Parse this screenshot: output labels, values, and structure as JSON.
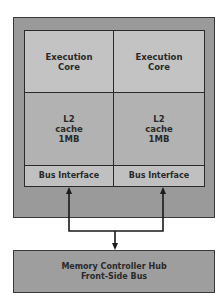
{
  "diagram": {
    "processor": {
      "cores": [
        {
          "execution_core": "Execution\nCore",
          "l2_cache": [
            "L2",
            "cache",
            "1MB"
          ],
          "bus_interface": "Bus Interface"
        },
        {
          "execution_core": "Execution\nCore",
          "l2_cache": [
            "L2",
            "cache",
            "1MB"
          ],
          "bus_interface": "Bus Interface"
        }
      ],
      "labels": {
        "core1_exec_line1": "Execution",
        "core1_exec_line2": "Core",
        "core2_exec_line1": "Execution",
        "core2_exec_line2": "Core",
        "core1_cache_line1": "L2",
        "core1_cache_line2": "cache",
        "core1_cache_line3": "1MB",
        "core2_cache_line1": "L2",
        "core2_cache_line2": "cache",
        "core2_cache_line3": "1MB",
        "core1_bus": "Bus Interface",
        "core2_bus": "Bus Interface"
      }
    },
    "memory_controller": {
      "line1": "Memory Controller Hub",
      "line2": "Front-Side Bus"
    },
    "colors": {
      "outer_package": "#9a9a9a",
      "execution_core": "#c3c3c3",
      "l2_cache": "#b2b2b2",
      "bus_interface": "#c0c0c0",
      "mch": "#9e9e9e",
      "lines": "#1a1a1a"
    }
  }
}
